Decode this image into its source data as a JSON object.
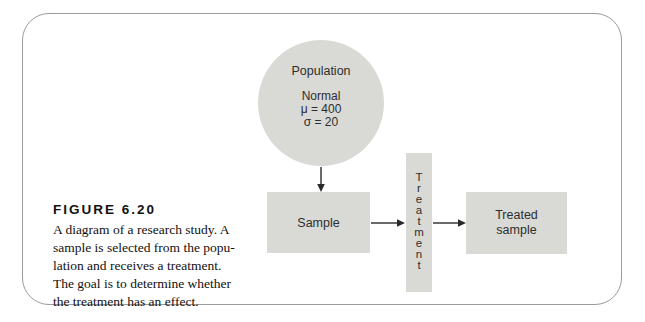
{
  "figure": {
    "label": "FIGURE 6.20",
    "caption_lines": [
      "A diagram of a research study. A",
      "sample is selected from the popu-",
      "lation and receives a treatment.",
      "The goal is to determine whether",
      "the treatment has an effect."
    ]
  },
  "diagram": {
    "population": {
      "title": "Population",
      "distribution": "Normal",
      "mu": "μ = 400",
      "sigma": "σ = 20"
    },
    "sample": {
      "label": "Sample"
    },
    "treatment": {
      "label": "Treatment",
      "stacked": "T\nr\ne\na\nt\nm\ne\nn\nt"
    },
    "treated_sample": {
      "label": "Treated sample",
      "stacked": "Treated\nsample"
    },
    "arrows": [
      "population-to-sample",
      "sample-to-treatment",
      "treatment-to-treated-sample"
    ]
  },
  "colors": {
    "shape_fill": "#d9d9d5",
    "frame_border": "#9b9b9b",
    "diagram_text": "#2e2e2e",
    "caption_text": "#111111",
    "arrow": "#2a2a2a",
    "background": "#ffffff"
  }
}
